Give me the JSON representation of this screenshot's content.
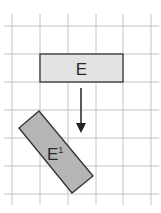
{
  "diagram": {
    "grid": {
      "color": "#c4c4c4",
      "vertical_x": [
        12,
        40,
        68,
        96,
        123,
        151
      ],
      "horizontal_y": [
        26,
        54,
        82,
        110,
        138,
        166,
        194
      ]
    },
    "shape_original": {
      "label": "E",
      "fill": "#e3e3e3",
      "stroke": "#333333"
    },
    "shape_transformed": {
      "label_main": "E",
      "label_sup": "1",
      "fill": "#b5b5b5",
      "stroke": "#333333"
    },
    "arrow": {
      "direction": "down",
      "color": "#222222"
    }
  }
}
